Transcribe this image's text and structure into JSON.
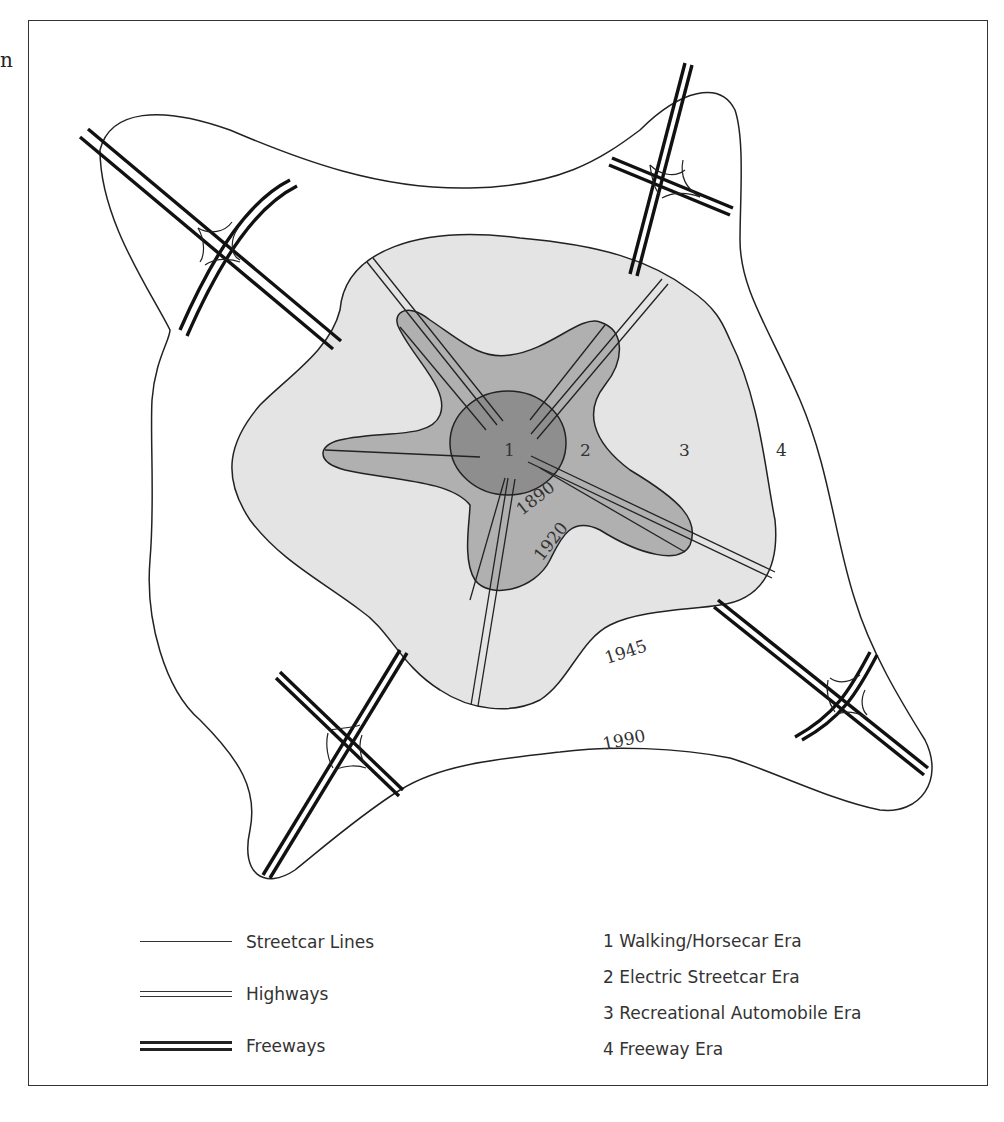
{
  "page": {
    "stray_text": "n"
  },
  "diagram": {
    "zone_labels": [
      "1",
      "2",
      "3",
      "4"
    ],
    "year_labels": [
      "1890",
      "1920",
      "1945",
      "1990"
    ],
    "colors": {
      "zone1_fill": "#8e8e8e",
      "zone2_fill": "#b0b0b0",
      "zone3_fill": "#e4e4e4",
      "zone4_fill": "#ffffff",
      "line": "#222222"
    }
  },
  "legend": {
    "line_types": [
      {
        "label": "Streetcar Lines",
        "style": "single-thin"
      },
      {
        "label": "Highways",
        "style": "double-thin"
      },
      {
        "label": "Freeways",
        "style": "double-thick"
      }
    ],
    "eras": [
      "1 Walking/Horsecar Era",
      "2 Electric Streetcar Era",
      "3 Recreational Automobile Era",
      "4 Freeway Era"
    ]
  }
}
